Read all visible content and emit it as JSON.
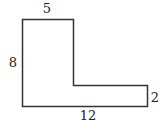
{
  "figure": {
    "shape": "L-shaped polygon",
    "labels": {
      "top": "5",
      "left": "8",
      "right": "2",
      "bottom": "12"
    },
    "colors": {
      "stroke": "#333333",
      "text": "#222222",
      "background": "#ffffff"
    }
  }
}
